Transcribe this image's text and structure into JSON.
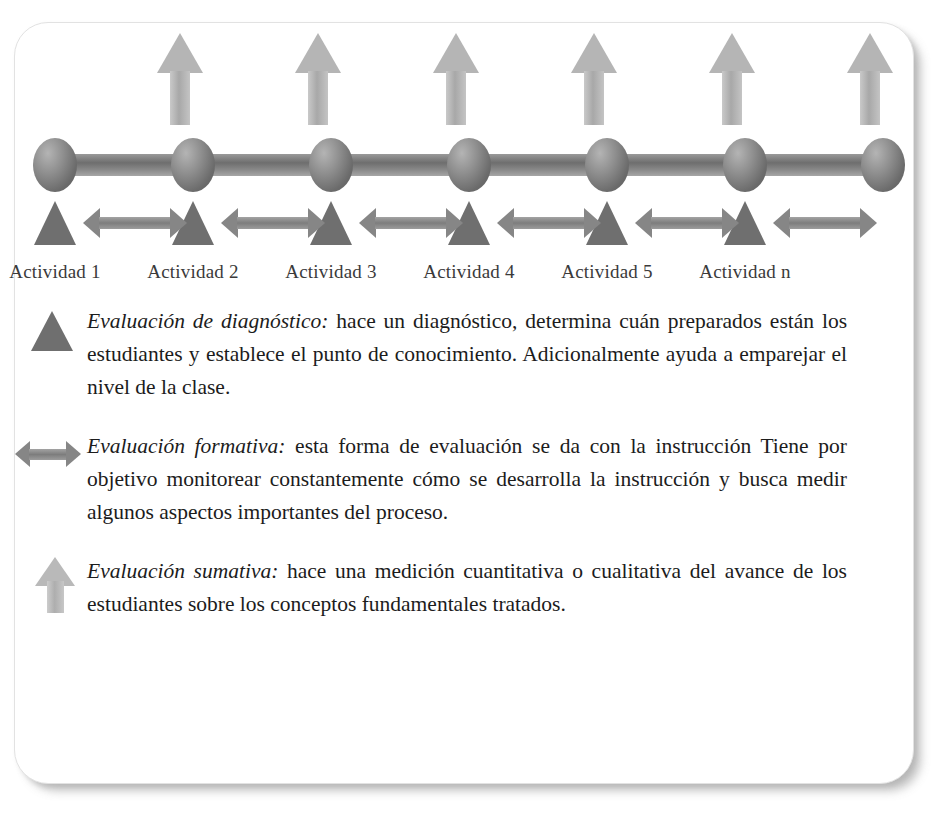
{
  "diagram": {
    "title_visible": false,
    "timeline": {
      "node_count": 7,
      "activities": [
        {
          "label": "Actividad 1"
        },
        {
          "label": "Actividad 2"
        },
        {
          "label": "Actividad 3"
        },
        {
          "label": "Actividad 4"
        },
        {
          "label": "Actividad 5"
        },
        {
          "label": "Actividad n"
        }
      ],
      "up_arrow_count": 6,
      "triangle_count": 6,
      "double_arrow_count": 6
    },
    "colors": {
      "sphere": "#6b6b6b",
      "bar": "#7d7d7d",
      "triangle": "#6f6f6f",
      "double_arrow": "#868686",
      "up_arrow": "#b5b5b5",
      "text": "#1c1c1c",
      "card_background": "#ffffff"
    }
  },
  "legend": {
    "items": [
      {
        "icon": "triangle-icon",
        "term": "Evaluación de diagnóstico:",
        "description": " hace un diagnóstico, determina cuán preparados están los estudiantes y establece el punto de conocimiento. Adicionalmente ayuda a emparejar el nivel de la clase."
      },
      {
        "icon": "double-arrow-icon",
        "term": "Evaluación formativa:",
        "description": " esta forma de evaluación se da con la instrucción Tiene por objetivo monitorear constantemente cómo se desarrolla la instrucción y busca medir algunos aspectos importantes del proceso."
      },
      {
        "icon": "up-arrow-icon",
        "term": "Evaluación sumativa:",
        "description": " hace una medición cuantitativa o cualitativa del avance de los estudiantes sobre los conceptos fundamentales tratados."
      }
    ]
  }
}
